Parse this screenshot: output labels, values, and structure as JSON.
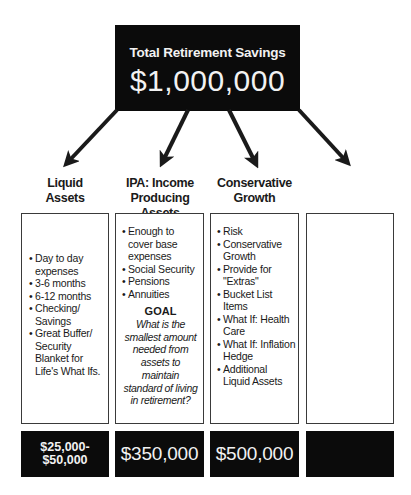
{
  "header": {
    "title": "Total Retirement Savings",
    "amount": "$1,000,000"
  },
  "columns": [
    {
      "heading_lines": [
        "Liquid",
        "Assets"
      ],
      "items": [
        "Day to day expenses",
        "3-6 months",
        "6-12 months",
        "Checking/ Savings",
        "Great Buffer/ Security Blanket for Life's What Ifs."
      ],
      "value": "$25,000-\n$50,000",
      "value_lines": [
        "$25,000-",
        "$50,000"
      ]
    },
    {
      "heading_lines": [
        "IPA: Income",
        "Producing Assets"
      ],
      "items": [
        "Enough to cover base expenses",
        "Social Security",
        "Pensions",
        "Annuities"
      ],
      "goal": {
        "label": "GOAL",
        "text": "What is the smallest amount needed from assets to maintain standard of living in retirement?"
      },
      "value": "$350,000"
    },
    {
      "heading_lines": [
        "Conservative",
        "Growth"
      ],
      "items": [
        "Risk",
        "Conservative Growth",
        "Provide for \"Extras\"",
        "Bucket List Items",
        "What If: Health Care",
        "What If: Inflation Hedge",
        "Additional Liquid Assets"
      ],
      "value": "$500,000"
    },
    {
      "heading_lines": [
        "",
        ""
      ],
      "items": [],
      "value": ""
    }
  ],
  "bullet_glyph": "•",
  "colors": {
    "dark_fill": "#0b0b0b",
    "light_text": "#f2f2f2",
    "border": "#3a3a3a",
    "background": "#ffffff"
  }
}
